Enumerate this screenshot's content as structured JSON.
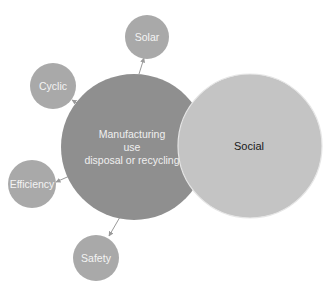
{
  "diagram": {
    "center": {
      "lines": [
        "Manufacturing",
        "use",
        "disposal or recycling"
      ],
      "color": "#8f8f8f",
      "text_color": "#f2f2f2"
    },
    "social": {
      "label": "Social",
      "color": "#c4c4c4",
      "text_color": "#1a1a1a"
    },
    "satellites": [
      {
        "label": "Solar",
        "color": "#a9a9a9"
      },
      {
        "label": "Cyclic",
        "color": "#a9a9a9"
      },
      {
        "label": "Efficiency",
        "color": "#a9a9a9"
      },
      {
        "label": "Safety",
        "color": "#a9a9a9"
      }
    ],
    "connector_color": "#9a9a9a"
  }
}
